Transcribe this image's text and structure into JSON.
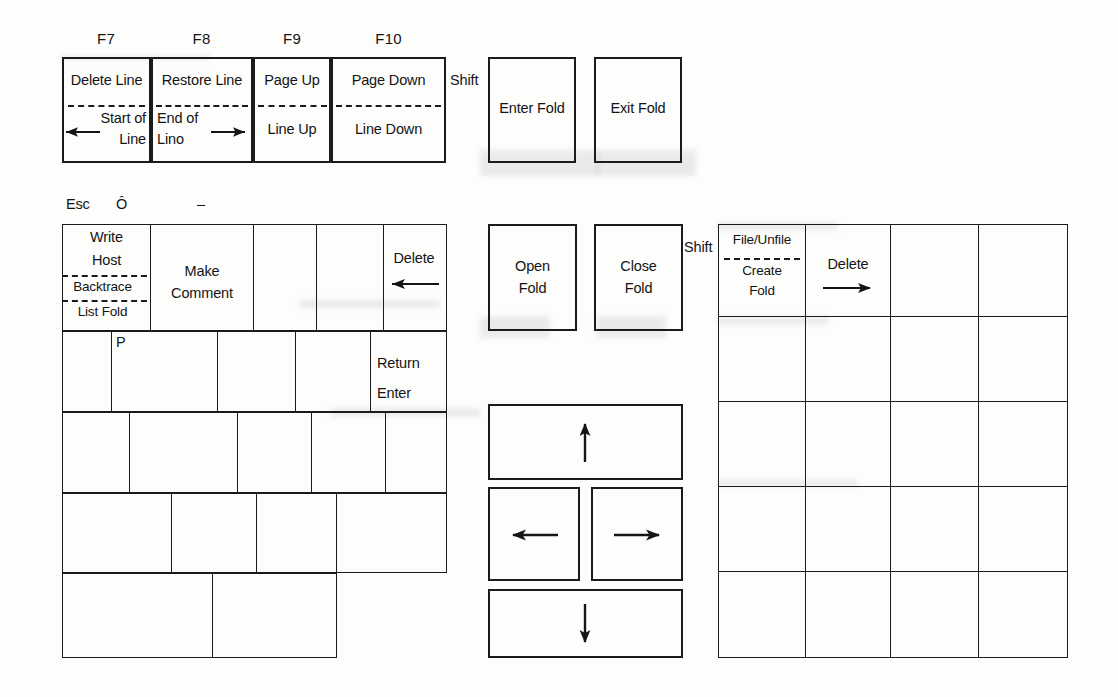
{
  "document": {
    "title": "Folding Editor Keyboard Template",
    "page_background": "#fdfdfc",
    "ink_color": "#1b1b1b"
  },
  "function_row": {
    "key_names": [
      "F7",
      "F8",
      "F9",
      "F10"
    ],
    "shift_label": "Shift",
    "keys": [
      {
        "name": "F7",
        "unshifted": "Delete Line",
        "shifted": "Start of Line",
        "shifted_line1": "Start of",
        "shifted_line2": "Line",
        "arrow": "left-arrow-icon",
        "divider": "dashed"
      },
      {
        "name": "F8",
        "unshifted": "Restore Line",
        "shifted": "End of Line",
        "shifted_line1": "End of",
        "shifted_line2": "Lino",
        "arrow": "right-arrow-icon",
        "divider": "dashed"
      },
      {
        "name": "F9",
        "unshifted": "Page Up",
        "shifted": "Line Up",
        "arrow": "",
        "divider": "dashed"
      },
      {
        "name": "F10",
        "unshifted": "Page Down",
        "shifted": "Line Down",
        "arrow": "",
        "divider": "dashed"
      }
    ],
    "fold_keys": [
      {
        "label": "Enter Fold"
      },
      {
        "label": "Exit Fold"
      }
    ]
  },
  "main_keyboard": {
    "top_legends": [
      {
        "text": "Esc"
      },
      {
        "text": "Ô"
      },
      {
        "text": "–"
      }
    ],
    "row1": [
      {
        "name": "write-host-backtrace-listfold-key",
        "lines": [
          "Write",
          "Host",
          "Backtrace",
          "List Fold"
        ],
        "dividers": [
          false,
          true,
          true
        ]
      },
      {
        "name": "make-comment-key",
        "lines": [
          "Make",
          "Comment"
        ]
      },
      {
        "name": "blank-key",
        "lines": []
      },
      {
        "name": "blank-key",
        "lines": []
      },
      {
        "name": "delete-left-key",
        "lines": [
          "Delete"
        ],
        "arrow": "left-arrow-icon"
      }
    ],
    "row2": [
      {
        "name": "blank-key",
        "lines": []
      },
      {
        "name": "p-key",
        "lines": [
          "P"
        ],
        "align": "top-left"
      },
      {
        "name": "blank-key",
        "lines": []
      },
      {
        "name": "blank-key",
        "lines": []
      },
      {
        "name": "return-enter-key",
        "lines": [
          "Return",
          "Enter"
        ]
      }
    ],
    "row3": [
      {
        "name": "blank-key",
        "lines": []
      },
      {
        "name": "blank-key",
        "lines": []
      },
      {
        "name": "blank-key",
        "lines": []
      },
      {
        "name": "blank-key",
        "lines": []
      },
      {
        "name": "blank-key",
        "lines": []
      }
    ],
    "row4": [
      {
        "name": "blank-key",
        "lines": []
      },
      {
        "name": "blank-key",
        "lines": []
      },
      {
        "name": "blank-key",
        "lines": []
      },
      {
        "name": "blank-key",
        "lines": []
      }
    ],
    "row5": [
      {
        "name": "blank-key",
        "lines": []
      },
      {
        "name": "spacebar-key",
        "lines": []
      },
      {
        "name": "blank-key",
        "lines": []
      }
    ]
  },
  "fold_cluster": {
    "shift_label": "Shift",
    "keys": [
      {
        "name": "open-fold-key",
        "line1": "Open",
        "line2": "Fold"
      },
      {
        "name": "close-fold-key",
        "line1": "Close",
        "line2": "Fold"
      }
    ]
  },
  "arrow_cluster": {
    "keys": [
      {
        "name": "arrow-up-key",
        "icon": "up-arrow-icon"
      },
      {
        "name": "arrow-left-key",
        "icon": "left-arrow-icon"
      },
      {
        "name": "arrow-right-key",
        "icon": "right-arrow-icon"
      },
      {
        "name": "arrow-down-key",
        "icon": "down-arrow-icon"
      }
    ]
  },
  "numeric_keypad": {
    "columns": 4,
    "rows": 5,
    "keys": [
      {
        "name": "file-unfile-create-fold-key",
        "row": 1,
        "col": 1,
        "top_label": "File/Unfile",
        "bottom_line1": "Create",
        "bottom_line2": "Fold",
        "divider": "dashed"
      },
      {
        "name": "delete-right-key",
        "row": 1,
        "col": 2,
        "top_label": "Delete",
        "arrow": "right-arrow-icon"
      },
      {
        "name": "blank-key",
        "row": 1,
        "col": 3
      },
      {
        "name": "blank-key",
        "row": 1,
        "col": 4
      },
      {
        "name": "blank-key",
        "row": 2,
        "col": 1
      },
      {
        "name": "blank-key",
        "row": 2,
        "col": 2
      },
      {
        "name": "blank-key",
        "row": 2,
        "col": 3
      },
      {
        "name": "blank-key",
        "row": 2,
        "col": 4
      },
      {
        "name": "blank-key",
        "row": 3,
        "col": 1
      },
      {
        "name": "blank-key",
        "row": 3,
        "col": 2
      },
      {
        "name": "blank-key",
        "row": 3,
        "col": 3
      },
      {
        "name": "blank-key",
        "row": 3,
        "col": 4
      },
      {
        "name": "blank-key",
        "row": 4,
        "col": 1
      },
      {
        "name": "blank-key",
        "row": 4,
        "col": 2
      },
      {
        "name": "blank-key",
        "row": 4,
        "col": 3
      },
      {
        "name": "blank-key",
        "row": 4,
        "col": 4
      },
      {
        "name": "blank-key",
        "row": 5,
        "col": 1
      },
      {
        "name": "blank-key",
        "row": 5,
        "col": 2
      },
      {
        "name": "blank-key",
        "row": 5,
        "col": 3
      },
      {
        "name": "blank-key",
        "row": 5,
        "col": 4
      }
    ]
  }
}
